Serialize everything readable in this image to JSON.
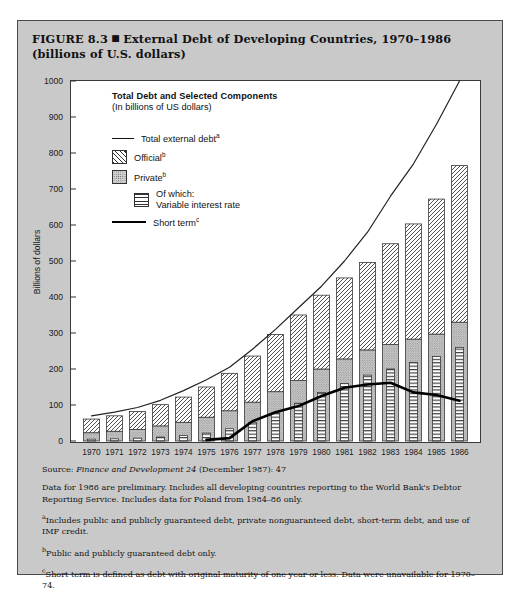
{
  "figure": {
    "title_prefix": "FIGURE 8.3",
    "title_text": "External Debt of Developing Countries, 1970–1986 (billions of U.S. dollars)"
  },
  "legend": {
    "title": "Total Debt and Selected Components",
    "subtitle": "(In billions of US dollars)",
    "items": [
      {
        "label": "Total external debt",
        "note": "a",
        "key": "line"
      },
      {
        "label": "Official",
        "note": "b",
        "key": "diagonal-hatch"
      },
      {
        "label": "Private",
        "note": "b",
        "key": "stipple"
      },
      {
        "label": "Of which:",
        "label2": "Variable interest rate",
        "note": "",
        "key": "horizontal-lines"
      },
      {
        "label": "Short term",
        "note": "c",
        "key": "thick-line"
      }
    ]
  },
  "notes": {
    "source_label": "Source:",
    "source_italic": "Finance and Development 24",
    "source_rest": "(December 1987): 47",
    "general": "Data for 1986 are preliminary. Includes all developing countries reporting to the World Bank's Debtor Reporting Service. Includes data for Poland from 1984–86 only.",
    "note_a_marker": "a",
    "note_a": "Includes public and publicly guaranteed debt, private nonguaranteed debt, short-term debt, and use of IMF credit.",
    "note_b_marker": "b",
    "note_b": "Public and publicly guaranteed debt only.",
    "note_c_marker": "c",
    "note_c": "Short term is defined as debt with original maturity of one year or less. Data were unavailable for 1970–74."
  },
  "chart_data": {
    "type": "bar",
    "title": "Total Debt and Selected Components",
    "subtitle": "(In billions of US dollars)",
    "xlabel": "",
    "ylabel": "Billions of dollars",
    "ylim": [
      0,
      1000
    ],
    "yticks": [
      0,
      100,
      200,
      300,
      400,
      500,
      600,
      700,
      800,
      900,
      1000
    ],
    "grid": false,
    "legend_position": "inside-top-left",
    "categories": [
      "1970",
      "1971",
      "1972",
      "1973",
      "1974",
      "1975",
      "1976",
      "1977",
      "1978",
      "1979",
      "1980",
      "1981",
      "1982",
      "1983",
      "1984",
      "1985",
      "1986"
    ],
    "stacked_series": [
      {
        "name": "Private",
        "note": "b",
        "pattern": "stipple",
        "values": [
          23,
          27,
          32,
          42,
          52,
          66,
          84,
          108,
          137,
          168,
          200,
          228,
          253,
          268,
          283,
          297,
          330
        ]
      },
      {
        "name": "Official",
        "note": "b",
        "pattern": "diagonal-hatch",
        "values": [
          38,
          43,
          50,
          59,
          70,
          84,
          104,
          128,
          159,
          182,
          205,
          225,
          243,
          280,
          320,
          375,
          435
        ]
      }
    ],
    "inset_series": [
      {
        "name": "Of which: Variable interest rate",
        "pattern": "horizontal-lines",
        "inside": "Private",
        "values": [
          5,
          6,
          8,
          11,
          15,
          22,
          34,
          52,
          78,
          105,
          135,
          160,
          183,
          200,
          218,
          235,
          260
        ]
      }
    ],
    "line_series": [
      {
        "name": "Total external debt",
        "note": "a",
        "style": "thin-line",
        "values": [
          70,
          80,
          93,
          113,
          140,
          170,
          205,
          255,
          310,
          370,
          430,
          500,
          580,
          680,
          770,
          880,
          1000
        ]
      },
      {
        "name": "Short term",
        "note": "c",
        "style": "thick-line",
        "values": [
          null,
          null,
          null,
          null,
          null,
          3,
          8,
          55,
          80,
          97,
          125,
          148,
          157,
          162,
          135,
          128,
          112
        ]
      }
    ]
  }
}
